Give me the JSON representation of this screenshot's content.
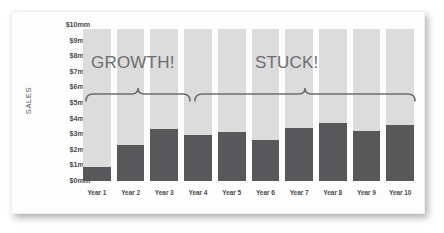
{
  "chart_data": {
    "type": "bar",
    "title": "",
    "xlabel": "",
    "ylabel": "SALES",
    "ylim": [
      0,
      10
    ],
    "grid": false,
    "legend": "none",
    "categories": [
      "Year 1",
      "Year 2",
      "Year 3",
      "Year 4",
      "Year 5",
      "Year 6",
      "Year 7",
      "Year 8",
      "Year 9",
      "Year 10"
    ],
    "values": [
      0.9,
      2.4,
      3.4,
      3.0,
      3.2,
      2.7,
      3.5,
      3.8,
      3.3,
      3.7
    ],
    "y_ticks": [
      "$10mm",
      "$9mm",
      "$8mm",
      "$7mm",
      "$6mm",
      "$5mm",
      "$4mm",
      "$3mm",
      "$2mm",
      "$1mm",
      "$0mm"
    ],
    "y_tick_values": [
      10,
      9,
      8,
      7,
      6,
      5,
      4,
      3,
      2,
      1,
      0
    ],
    "annotations": [
      {
        "label": "GROWTH!",
        "spans_categories": [
          "Year 1",
          "Year 2",
          "Year 3"
        ],
        "type": "brace"
      },
      {
        "label": "STUCK!",
        "spans_categories": [
          "Year 4",
          "Year 5",
          "Year 6",
          "Year 7",
          "Year 8",
          "Year 9",
          "Year 10"
        ],
        "type": "brace"
      }
    ],
    "colors": {
      "bar": "#58585a",
      "column_background": "#dcdcdc",
      "annotation": "#6d6e70",
      "axis_text": "#4d4d4f",
      "card_background": "#fdfdfd"
    }
  }
}
